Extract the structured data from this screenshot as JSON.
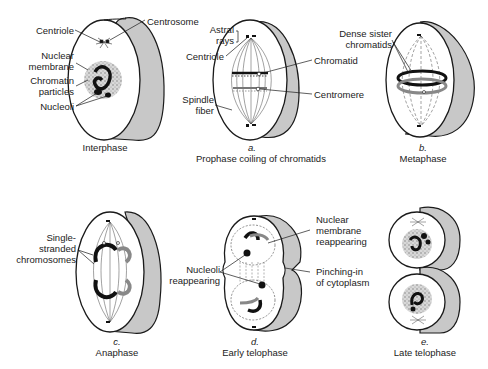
{
  "figure": {
    "colors": {
      "outline": "#1a1a1a",
      "cell_side": "#c8c8c8",
      "grey_chromatid": "#8c8c8c",
      "nucleus_stipple": "#b5b5b5",
      "background": "#ffffff"
    }
  },
  "panels": [
    {
      "id": "interphase",
      "letter": "",
      "caption": "Interphase",
      "labels": [
        "Centriole",
        "Centrosome",
        "Nuclear membrane",
        "Chromatin particles",
        "Nucleoli"
      ]
    },
    {
      "id": "prophase",
      "letter": "a.",
      "caption": "Prophase coiling of chromatids",
      "labels": [
        "Astral rays",
        "Centriole",
        "Chromatid",
        "Centromere",
        "Spindle fiber"
      ]
    },
    {
      "id": "metaphase",
      "letter": "b.",
      "caption": "Metaphase",
      "labels": [
        "Dense sister chromatids"
      ]
    },
    {
      "id": "anaphase",
      "letter": "c.",
      "caption": "Anaphase",
      "labels": [
        "Single-stranded chromosomes"
      ]
    },
    {
      "id": "early-telophase",
      "letter": "d.",
      "caption": "Early telophase",
      "labels": [
        "Nuclear membrane reappearing",
        "Nucleoli reappearing",
        "Pinching-in of cytoplasm"
      ]
    },
    {
      "id": "late-telophase",
      "letter": "e.",
      "caption": "Late telophase",
      "labels": []
    }
  ],
  "text": {
    "centriole": "Centriole",
    "centrosome": "Centrosome",
    "nuclear": "Nuclear",
    "membrane": "membrane",
    "chromatin": "Chromatin",
    "particles": "particles",
    "nucleoli": "Nucleoli",
    "astral": "Astral",
    "rays": "rays",
    "centriole_a": "Centriole",
    "chromatid": "Chromatid",
    "centromere": "Centromere",
    "spindle": "Spindle",
    "fiber": "fiber",
    "dense_sister": "Dense sister",
    "chromatids": "chromatids",
    "single": "Single-",
    "stranded": "stranded",
    "chromosomes": "chromosomes",
    "nuclear_d": "Nuclear",
    "membrane_d": "membrane",
    "reappearing_d": "reappearing",
    "nucleoli_d": "Nucleoli",
    "reappearing_n": "reappearing",
    "pinching": "Pinching-in",
    "of_cytoplasm": "of cytoplasm"
  }
}
